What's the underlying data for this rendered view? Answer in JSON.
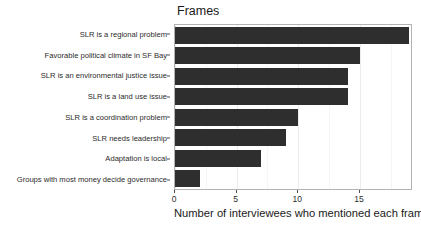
{
  "chart_data": {
    "type": "bar",
    "orientation": "horizontal",
    "title": "Frames",
    "xlabel": "Number of interviewees who mentioned each frame",
    "ylabel": "",
    "xlim": [
      0,
      19.3
    ],
    "xticks": [
      0,
      5,
      10,
      15
    ],
    "xticklabels": [
      "0",
      "5",
      "10",
      "15"
    ],
    "grid": true,
    "legend": "none",
    "bar_color": "#2e2e2e",
    "panel_border_color": "#b3b3b3",
    "categories": [
      "SLR is a regional problem",
      "Favorable political climate in SF Bay",
      "SLR is an environmental justice issue",
      "SLR is a land use issue",
      "SLR is a coordination problem",
      "SLR needs leadership",
      "Adaptation is local",
      "Groups with most money decide governance"
    ],
    "values": [
      19,
      15,
      14,
      14,
      10,
      9,
      7,
      2
    ]
  }
}
